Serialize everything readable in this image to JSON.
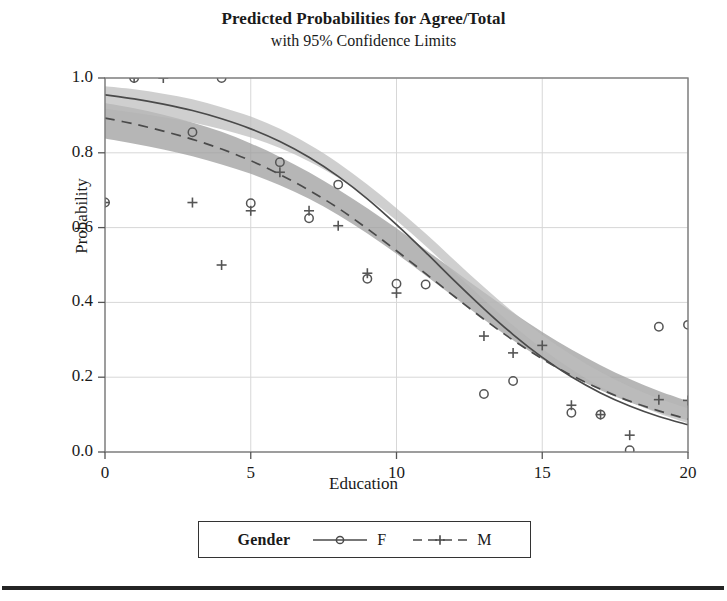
{
  "title": {
    "main": "Predicted Probabilities for Agree/Total",
    "sub": "with 95% Confidence Limits"
  },
  "axes": {
    "xlabel": "Education",
    "ylabel": "Probability",
    "xticks": [
      "0",
      "5",
      "10",
      "15",
      "20"
    ],
    "yticks": [
      "0.0",
      "0.2",
      "0.4",
      "0.6",
      "0.8",
      "1.0"
    ]
  },
  "legend": {
    "title": "Gender",
    "entries": [
      {
        "label": "F",
        "marker": "circle-marker",
        "line": "solid"
      },
      {
        "label": "M",
        "marker": "plus-marker",
        "line": "dashed"
      }
    ]
  },
  "colors": {
    "curve_f": "#4a4a4a",
    "curve_m": "#4a4a4a",
    "band_f": "#b9b9b9",
    "band_m": "#a0a0a0",
    "marker": "#555555",
    "grid": "#d7d7d7",
    "frame": "#8a8a8a",
    "rule": "#242424"
  },
  "chart_data": {
    "type": "line",
    "title": "Predicted Probabilities for Agree/Total with 95% Confidence Limits",
    "xlabel": "Education",
    "ylabel": "Probability",
    "xlim": [
      0,
      20
    ],
    "ylim": [
      0.0,
      1.0
    ],
    "xticks": [
      0,
      5,
      10,
      15,
      20
    ],
    "yticks": [
      0.0,
      0.2,
      0.4,
      0.6,
      0.8,
      1.0
    ],
    "grid": true,
    "legend_position": "below-axes",
    "legend_title": "Gender",
    "series": [
      {
        "name": "F",
        "style": "solid",
        "marker": "circle",
        "x": [
          0,
          1,
          2,
          3,
          4,
          5,
          6,
          7,
          8,
          9,
          10,
          11,
          12,
          13,
          14,
          15,
          16,
          17,
          18,
          19,
          20
        ],
        "fit": [
          0.955,
          0.944,
          0.93,
          0.913,
          0.891,
          0.864,
          0.83,
          0.788,
          0.737,
          0.677,
          0.608,
          0.534,
          0.457,
          0.383,
          0.314,
          0.253,
          0.201,
          0.158,
          0.123,
          0.095,
          0.073
        ],
        "lower": [
          0.918,
          0.907,
          0.895,
          0.881,
          0.863,
          0.841,
          0.813,
          0.777,
          0.733,
          0.68,
          0.619,
          0.551,
          0.479,
          0.407,
          0.338,
          0.276,
          0.221,
          0.174,
          0.135,
          0.103,
          0.077
        ],
        "upper": [
          0.978,
          0.97,
          0.958,
          0.943,
          0.922,
          0.897,
          0.864,
          0.822,
          0.773,
          0.715,
          0.652,
          0.584,
          0.512,
          0.441,
          0.374,
          0.313,
          0.26,
          0.214,
          0.175,
          0.143,
          0.117
        ],
        "observed_x": [
          0,
          1,
          3,
          4,
          5,
          6,
          7,
          8,
          9,
          10,
          11,
          13,
          14,
          16,
          17,
          18,
          19,
          20
        ],
        "observed_y": [
          0.667,
          1.0,
          0.855,
          1.0,
          0.665,
          0.775,
          0.625,
          0.715,
          0.463,
          0.45,
          0.448,
          0.155,
          0.19,
          0.105,
          0.1,
          0.005,
          0.335,
          0.34
        ]
      },
      {
        "name": "M",
        "style": "dashed",
        "marker": "plus",
        "x": [
          0,
          1,
          2,
          3,
          4,
          5,
          6,
          7,
          8,
          9,
          10,
          11,
          12,
          13,
          14,
          15,
          16,
          17,
          18,
          19,
          20
        ],
        "fit": [
          0.893,
          0.877,
          0.858,
          0.836,
          0.81,
          0.779,
          0.742,
          0.7,
          0.652,
          0.597,
          0.538,
          0.477,
          0.415,
          0.355,
          0.299,
          0.249,
          0.205,
          0.168,
          0.136,
          0.11,
          0.088
        ],
        "lower": [
          0.838,
          0.824,
          0.809,
          0.791,
          0.769,
          0.744,
          0.713,
          0.677,
          0.634,
          0.584,
          0.53,
          0.472,
          0.413,
          0.354,
          0.299,
          0.248,
          0.204,
          0.165,
          0.133,
          0.106,
          0.084
        ],
        "upper": [
          0.933,
          0.919,
          0.902,
          0.881,
          0.856,
          0.825,
          0.789,
          0.748,
          0.702,
          0.652,
          0.598,
          0.541,
          0.484,
          0.427,
          0.372,
          0.321,
          0.274,
          0.232,
          0.195,
          0.163,
          0.136
        ],
        "observed_x": [
          0,
          1,
          2,
          3,
          4,
          5,
          6,
          7,
          8,
          9,
          10,
          13,
          14,
          15,
          16,
          17,
          18,
          19,
          20
        ],
        "observed_y": [
          0.667,
          1.0,
          1.0,
          0.667,
          0.5,
          0.645,
          0.748,
          0.645,
          0.605,
          0.478,
          0.425,
          0.31,
          0.265,
          0.285,
          0.125,
          0.1,
          0.045,
          0.14,
          0.138
        ]
      }
    ]
  }
}
